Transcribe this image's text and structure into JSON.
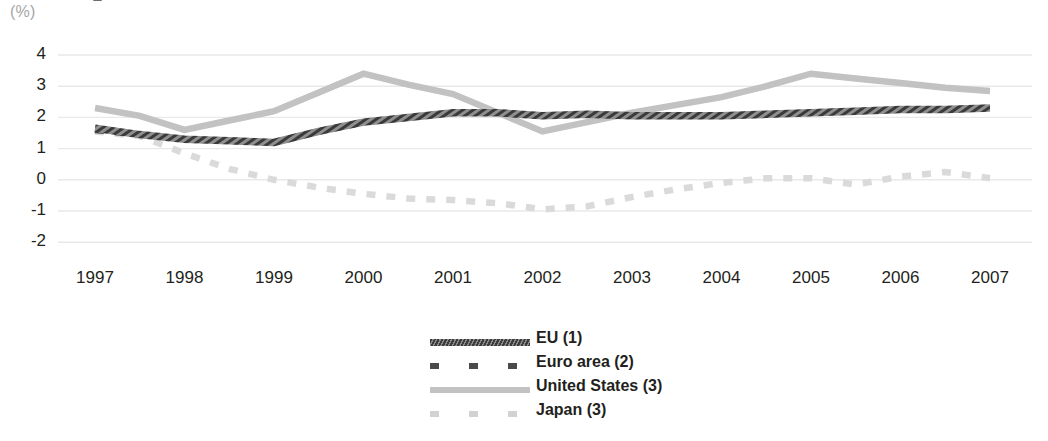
{
  "unit_label": "(%)",
  "chart_data": {
    "type": "line",
    "title": "",
    "subtitle": "",
    "xlabel": "",
    "ylabel": "(%)",
    "ylim": [
      -2,
      4
    ],
    "xlim": [
      1997,
      2007
    ],
    "grid": true,
    "legend_position": "bottom-center",
    "y_ticks": [
      "4",
      "3",
      "2",
      "1",
      "0",
      "-1",
      "-2"
    ],
    "x_ticks": [
      "1997",
      "1998",
      "1999",
      "2000",
      "2001",
      "2002",
      "2003",
      "2004",
      "2005",
      "2006",
      "2007"
    ],
    "x": [
      1997,
      1997.5,
      1998,
      1998.5,
      1999,
      1999.5,
      2000,
      2000.5,
      2001,
      2001.5,
      2002,
      2002.5,
      2003,
      2003.5,
      2004,
      2004.5,
      2005,
      2005.5,
      2006,
      2006.5,
      2007
    ],
    "series": [
      {
        "name": "EU (1)",
        "color": "#3d3d3d",
        "style": "solid-hatched",
        "values": [
          1.65,
          1.45,
          1.3,
          1.25,
          1.2,
          1.55,
          1.85,
          2.0,
          2.15,
          2.15,
          2.05,
          2.1,
          2.05,
          2.05,
          2.05,
          2.1,
          2.15,
          2.2,
          2.25,
          2.25,
          2.3
        ]
      },
      {
        "name": "Euro area (2)",
        "color": "#4a4a4a",
        "style": "dashed",
        "values": [
          1.6,
          1.45,
          1.3,
          1.25,
          1.2,
          1.55,
          1.85,
          2.0,
          2.15,
          2.15,
          2.05,
          2.1,
          2.05,
          2.05,
          2.05,
          2.1,
          2.15,
          2.2,
          2.25,
          2.25,
          2.3
        ]
      },
      {
        "name": "United States (3)",
        "color": "#c2c2c2",
        "style": "solid",
        "values": [
          2.3,
          2.05,
          1.6,
          1.9,
          2.2,
          2.8,
          3.4,
          3.05,
          2.75,
          2.15,
          1.55,
          1.85,
          2.15,
          2.4,
          2.65,
          3.0,
          3.4,
          3.25,
          3.1,
          2.95,
          2.85
        ]
      },
      {
        "name": "Japan (3)",
        "color": "#d2d2d2",
        "style": "dashed",
        "values": [
          1.55,
          1.4,
          0.85,
          0.35,
          0.0,
          -0.25,
          -0.45,
          -0.6,
          -0.65,
          -0.75,
          -0.95,
          -0.85,
          -0.55,
          -0.3,
          -0.1,
          0.05,
          0.05,
          -0.15,
          0.1,
          0.25,
          0.05
        ]
      }
    ]
  }
}
